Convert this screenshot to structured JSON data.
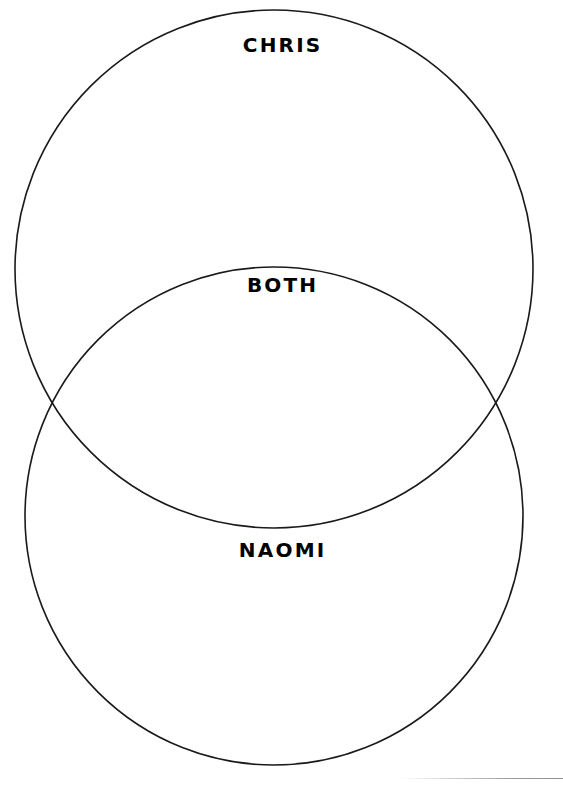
{
  "document": {
    "title": "Venn Diagram Worksheet",
    "background_color": "#ffffff",
    "stroke_color": "#1a1a1a",
    "text_color": "#000000",
    "width": 563,
    "height": 785
  },
  "diagram": {
    "type": "venn-2-set-vertical",
    "circles": [
      {
        "id": "upper",
        "label_key": "set_a",
        "center_x": 274,
        "center_y": 269,
        "radius": 259
      },
      {
        "id": "lower",
        "label_key": "set_b",
        "center_x": 274,
        "center_y": 516,
        "radius": 249
      }
    ],
    "intersection_points": [
      {
        "x": 50,
        "y": 392
      },
      {
        "x": 513,
        "y": 392
      }
    ],
    "labels": {
      "set_a": "CHRIS",
      "intersection": "BOTH",
      "set_b": "NAOMI"
    }
  },
  "footer": {
    "page_edge_rule_visible": true
  }
}
